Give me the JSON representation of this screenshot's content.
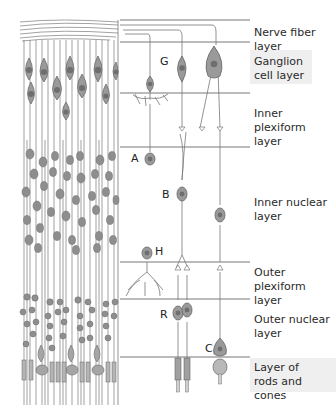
{
  "figure": {
    "type": "retina-layers-diagram",
    "layers": [
      {
        "id": "nerve-fiber",
        "label": "Nerve fiber layer",
        "top": 20,
        "bottom": 42,
        "label_y": 26
      },
      {
        "id": "ganglion-cell",
        "label": "Ganglion\ncell layer",
        "top": 42,
        "bottom": 93,
        "label_y": 55
      },
      {
        "id": "inner-plexiform",
        "label": "Inner plexiform\nlayer",
        "top": 93,
        "bottom": 147,
        "label_y": 107
      },
      {
        "id": "inner-nuclear",
        "label": "Inner nuclear\nlayer",
        "top": 147,
        "bottom": 262,
        "label_y": 196
      },
      {
        "id": "outer-plexiform",
        "label": "Outer plexiform\nlayer",
        "top": 262,
        "bottom": 299,
        "label_y": 266
      },
      {
        "id": "outer-nuclear",
        "label": "Outer nuclear\nlayer",
        "top": 299,
        "bottom": 357,
        "label_y": 313
      },
      {
        "id": "rods-cones",
        "label": "Layer of\nrods and cones",
        "top": 357,
        "bottom": 405,
        "label_y": 361
      }
    ],
    "cell_labels": [
      {
        "id": "G",
        "text": "G",
        "x": 160,
        "y": 55,
        "cell": "ganglion cell"
      },
      {
        "id": "A",
        "text": "A",
        "x": 131,
        "y": 154,
        "cell": "amacrine cell"
      },
      {
        "id": "B",
        "text": "B",
        "x": 162,
        "y": 191,
        "cell": "bipolar cell"
      },
      {
        "id": "H",
        "text": "H",
        "x": 155,
        "y": 245,
        "cell": "horizontal cell"
      },
      {
        "id": "R",
        "text": "R",
        "x": 160,
        "y": 310,
        "cell": "rod"
      },
      {
        "id": "C",
        "text": "C",
        "x": 205,
        "y": 343,
        "cell": "cone"
      }
    ],
    "colors": {
      "line": "#555555",
      "cell_body": "#9a9a9a",
      "nucleus": "#6e6e6e",
      "fiber": "#7a7a7a",
      "label": "#2a2a2a"
    }
  }
}
